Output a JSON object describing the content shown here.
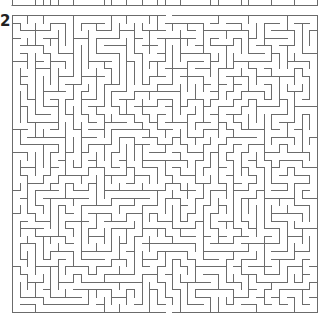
{
  "puzzle": {
    "label": "2",
    "type": "maze",
    "colors": {
      "wall": "#6b6b6b",
      "background": "#ffffff",
      "label": "#222222"
    },
    "maze": {
      "left": 12,
      "top": 15,
      "right": 317,
      "bottom": 312,
      "cols": 40,
      "rows": 39,
      "seed": 20240517,
      "wall_width": 1
    },
    "previous_maze_strip": {
      "left": 12,
      "right": 317,
      "bottom_line_y": 5,
      "visible_height": 6,
      "cols": 40
    }
  }
}
